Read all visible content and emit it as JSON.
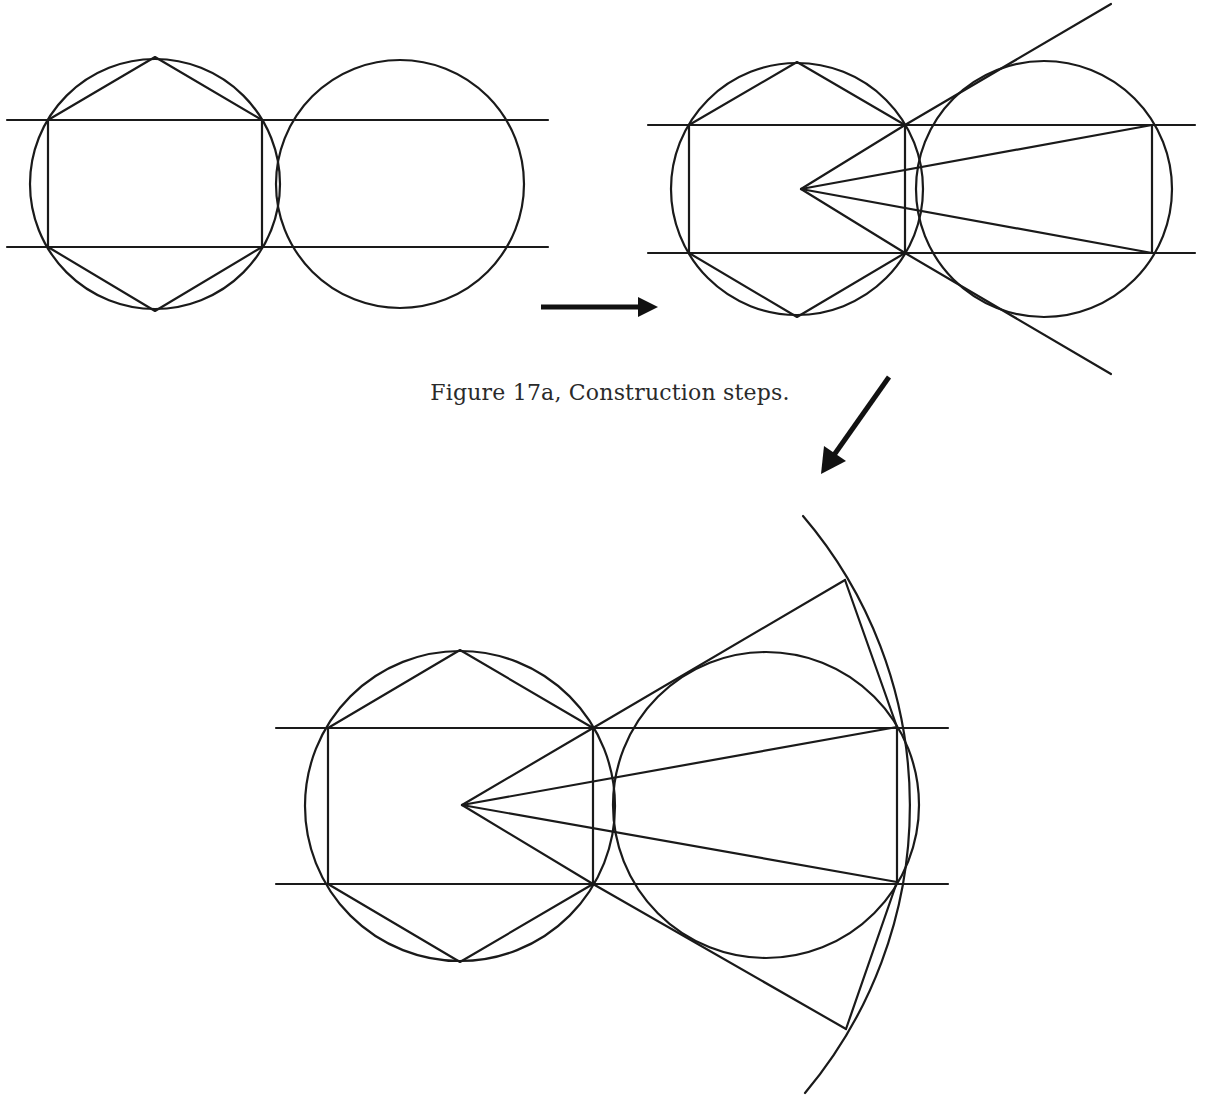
{
  "caption": "Figure 17a, Construction steps.",
  "colors": {
    "line": "#1a1a1a",
    "arrow": "#111111",
    "background": "#ffffff"
  },
  "figures": [
    {
      "id": "step-1",
      "description": "Hexagon inscribed in circle with bounding horizontal lines; adjacent equal circle",
      "circles": [
        {
          "cx": 155,
          "cy": 184,
          "r": 125
        },
        {
          "cx": 400,
          "cy": 184,
          "r": 124
        }
      ],
      "horizontal_lines_y": [
        120,
        247
      ],
      "line_x_range": [
        7,
        548
      ],
      "hexagon": [
        [
          155,
          57
        ],
        [
          262,
          120
        ],
        [
          262,
          247
        ],
        [
          155,
          311
        ],
        [
          48,
          247
        ],
        [
          48,
          120
        ]
      ]
    },
    {
      "id": "step-2",
      "description": "Rays from central point to rectangle corners and tangent lines to second circle",
      "circles": [
        {
          "cx": 797,
          "cy": 189,
          "r": 126
        },
        {
          "cx": 1044,
          "cy": 189,
          "r": 128
        }
      ],
      "horizontal_lines_y": [
        125,
        253
      ],
      "line_x_range": [
        648,
        1195
      ],
      "hexagon": [
        [
          797,
          62
        ],
        [
          905,
          125
        ],
        [
          905,
          253
        ],
        [
          797,
          317
        ],
        [
          689,
          253
        ],
        [
          689,
          125
        ]
      ],
      "center_point": [
        801,
        189
      ],
      "rays_to": [
        [
          905,
          125
        ],
        [
          905,
          253
        ],
        [
          1152,
          125
        ],
        [
          1152,
          253
        ]
      ],
      "tangents": [
        [
          [
            905,
            125
          ],
          [
            1111,
            4
          ]
        ],
        [
          [
            905,
            253
          ],
          [
            1111,
            374
          ]
        ]
      ]
    },
    {
      "id": "step-3",
      "description": "Completed construction with large arc centred at the central point",
      "circles": [
        {
          "cx": 460,
          "cy": 806,
          "r": 155
        },
        {
          "cx": 766,
          "cy": 805,
          "r": 153
        }
      ],
      "horizontal_lines_y": [
        728,
        884
      ],
      "line_x_range": [
        276,
        948
      ],
      "hexagon": [
        [
          460,
          650
        ],
        [
          593,
          728
        ],
        [
          593,
          884
        ],
        [
          460,
          962
        ],
        [
          328,
          884
        ],
        [
          328,
          728
        ]
      ],
      "center_point": [
        462,
        805
      ],
      "rays_to": [
        [
          593,
          728
        ],
        [
          593,
          884
        ],
        [
          897,
          727
        ],
        [
          897,
          882
        ]
      ],
      "tangents": [
        [
          [
            593,
            728
          ],
          [
            845,
            580
          ]
        ],
        [
          [
            593,
            884
          ],
          [
            846,
            1029
          ]
        ]
      ],
      "chords": [
        [
          [
            845,
            580
          ],
          [
            897,
            727
          ]
        ],
        [
          [
            846,
            1029
          ],
          [
            897,
            882
          ]
        ]
      ],
      "arc": {
        "r": 446,
        "from": [
          803,
          516
        ],
        "to": [
          805,
          1093
        ]
      }
    }
  ],
  "arrows": [
    {
      "name": "step-1-to-step-2",
      "from": [
        541,
        307
      ],
      "to": [
        658,
        307
      ]
    },
    {
      "name": "step-2-to-step-3",
      "from": [
        889,
        377
      ],
      "to": [
        821,
        474
      ]
    }
  ]
}
